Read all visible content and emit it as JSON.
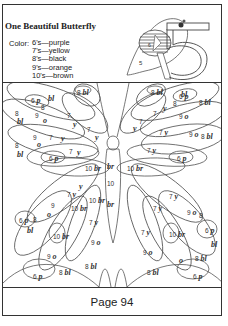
{
  "worksheet": {
    "title": "One Beautiful Butterfly",
    "color_label": "Color:",
    "legend": [
      {
        "number": "6",
        "text": "6's—purple",
        "code": "p"
      },
      {
        "number": "7",
        "text": "7's—yellow",
        "code": "y"
      },
      {
        "number": "8",
        "text": "8's—black",
        "code": "bl"
      },
      {
        "number": "9",
        "text": "9's—orange",
        "code": "o"
      },
      {
        "number": "10",
        "text": "10's—brown",
        "code": "br"
      }
    ],
    "logo": {
      "numeral": "5",
      "side_number": "5",
      "inner_number": "6"
    },
    "page_label": "Page 94"
  },
  "butterfly_labels": [
    {
      "x": 28,
      "y": 14,
      "n": "6",
      "c": "p"
    },
    {
      "x": 45,
      "y": 12,
      "n": "",
      "c": "bl"
    },
    {
      "x": 74,
      "y": 6,
      "n": "8",
      "c": "bl"
    },
    {
      "x": 148,
      "y": 6,
      "n": "8",
      "c": "bl"
    },
    {
      "x": 38,
      "y": 22,
      "n": "8",
      "c": ""
    },
    {
      "x": 12,
      "y": 28,
      "n": "8",
      "c": ""
    },
    {
      "x": 14,
      "y": 35,
      "n": "",
      "c": "bl"
    },
    {
      "x": 32,
      "y": 30,
      "n": "9",
      "c": ""
    },
    {
      "x": 40,
      "y": 34,
      "n": "",
      "c": "o"
    },
    {
      "x": 64,
      "y": 30,
      "n": "7",
      "c": ""
    },
    {
      "x": 70,
      "y": 38,
      "n": "",
      "c": "y"
    },
    {
      "x": 84,
      "y": 44,
      "n": "7",
      "c": ""
    },
    {
      "x": 92,
      "y": 51,
      "n": "",
      "c": "y"
    },
    {
      "x": 30,
      "y": 52,
      "n": "9",
      "c": ""
    },
    {
      "x": 34,
      "y": 58,
      "n": "",
      "c": "o"
    },
    {
      "x": 46,
      "y": 52,
      "n": "7",
      "c": ""
    },
    {
      "x": 58,
      "y": 52,
      "n": "",
      "c": "y"
    },
    {
      "x": 12,
      "y": 60,
      "n": "8",
      "c": ""
    },
    {
      "x": 14,
      "y": 68,
      "n": "",
      "c": "bl"
    },
    {
      "x": 46,
      "y": 72,
      "n": "6",
      "c": "p"
    },
    {
      "x": 66,
      "y": 66,
      "n": "7",
      "c": ""
    },
    {
      "x": 74,
      "y": 66,
      "n": "",
      "c": "y"
    },
    {
      "x": 82,
      "y": 82,
      "n": "10",
      "c": "br"
    },
    {
      "x": 176,
      "y": 10,
      "n": "6",
      "c": "p"
    },
    {
      "x": 170,
      "y": 18,
      "n": "8",
      "c": "",
      "bl": 1
    },
    {
      "x": 178,
      "y": 8,
      "n": "",
      "c": "bl"
    },
    {
      "x": 196,
      "y": 16,
      "n": "8",
      "c": "bl"
    },
    {
      "x": 150,
      "y": 28,
      "n": "7",
      "c": ""
    },
    {
      "x": 160,
      "y": 22,
      "n": "",
      "c": "y"
    },
    {
      "x": 176,
      "y": 30,
      "n": "9",
      "c": "o"
    },
    {
      "x": 130,
      "y": 42,
      "n": "",
      "c": "y"
    },
    {
      "x": 136,
      "y": 36,
      "n": "7",
      "c": ""
    },
    {
      "x": 156,
      "y": 46,
      "n": "7",
      "c": "y"
    },
    {
      "x": 186,
      "y": 48,
      "n": "9",
      "c": "o"
    },
    {
      "x": 198,
      "y": 50,
      "n": "8",
      "c": "bl"
    },
    {
      "x": 144,
      "y": 64,
      "n": "7",
      "c": "y"
    },
    {
      "x": 174,
      "y": 72,
      "n": "6",
      "c": "p"
    },
    {
      "x": 124,
      "y": 82,
      "n": "10",
      "c": "br"
    },
    {
      "x": 104,
      "y": 80,
      "n": "",
      "c": "br"
    },
    {
      "x": 104,
      "y": 98,
      "n": "10",
      "c": ""
    },
    {
      "x": 104,
      "y": 118,
      "n": "",
      "c": "br"
    },
    {
      "x": 76,
      "y": 100,
      "n": "",
      "c": "y"
    },
    {
      "x": 64,
      "y": 108,
      "n": "7",
      "c": "y"
    },
    {
      "x": 68,
      "y": 122,
      "n": "10",
      "c": "br"
    },
    {
      "x": 48,
      "y": 120,
      "n": "9",
      "c": ""
    },
    {
      "x": 44,
      "y": 128,
      "n": "",
      "c": "o"
    },
    {
      "x": 86,
      "y": 114,
      "n": "10",
      "c": "br"
    },
    {
      "x": 86,
      "y": 136,
      "n": "7",
      "c": "y"
    },
    {
      "x": 16,
      "y": 134,
      "n": "6",
      "c": "p"
    },
    {
      "x": 30,
      "y": 134,
      "n": "8",
      "c": ""
    },
    {
      "x": 24,
      "y": 144,
      "n": "",
      "c": "bl"
    },
    {
      "x": 50,
      "y": 150,
      "n": "10",
      "c": "br"
    },
    {
      "x": 44,
      "y": 170,
      "n": "9",
      "c": "o"
    },
    {
      "x": 88,
      "y": 156,
      "n": "9",
      "c": "o"
    },
    {
      "x": 56,
      "y": 186,
      "n": "8",
      "c": "bl"
    },
    {
      "x": 82,
      "y": 180,
      "n": "8",
      "c": "bl"
    },
    {
      "x": 30,
      "y": 190,
      "n": "6",
      "c": "p"
    },
    {
      "x": 166,
      "y": 110,
      "n": "7",
      "c": "y"
    },
    {
      "x": 150,
      "y": 122,
      "n": "7",
      "c": "y"
    },
    {
      "x": 184,
      "y": 126,
      "n": "9",
      "c": "o"
    },
    {
      "x": 196,
      "y": 130,
      "n": "8",
      "c": ""
    },
    {
      "x": 202,
      "y": 144,
      "n": "6",
      "c": "p"
    },
    {
      "x": 208,
      "y": 158,
      "n": "",
      "c": "bl"
    },
    {
      "x": 138,
      "y": 146,
      "n": "7",
      "c": "y"
    },
    {
      "x": 166,
      "y": 148,
      "n": "10",
      "c": "br"
    },
    {
      "x": 140,
      "y": 166,
      "n": "9",
      "c": "o"
    },
    {
      "x": 176,
      "y": 174,
      "n": "",
      "c": "o"
    },
    {
      "x": 192,
      "y": 172,
      "n": "8",
      "c": "bl"
    },
    {
      "x": 144,
      "y": 186,
      "n": "8",
      "c": "bl"
    },
    {
      "x": 190,
      "y": 190,
      "n": "6",
      "c": "p"
    }
  ]
}
